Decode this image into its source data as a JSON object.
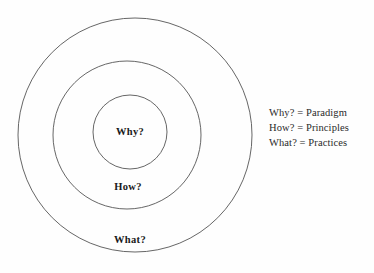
{
  "diagram": {
    "type": "concentric-circles",
    "background_color": "#fefefe",
    "stroke_color": "#555555",
    "label_color": "#1a1a1a",
    "rings": [
      {
        "id": "outer",
        "label": "What?",
        "cx": 135,
        "cy": 135,
        "r": 117
      },
      {
        "id": "middle",
        "label": "How?",
        "cx": 127,
        "cy": 135,
        "r": 74
      },
      {
        "id": "inner",
        "label": "Why?",
        "cx": 130,
        "cy": 132,
        "r": 37
      }
    ]
  },
  "legend": {
    "items": [
      {
        "term": "Why?",
        "equals": "=",
        "definition": "Paradigm",
        "text": "Why? = Paradigm"
      },
      {
        "term": "How?",
        "equals": "=",
        "definition": "Principles",
        "text": "How? = Principles"
      },
      {
        "term": "What?",
        "equals": "=",
        "definition": "Practices",
        "text": "What? = Practices"
      }
    ]
  }
}
